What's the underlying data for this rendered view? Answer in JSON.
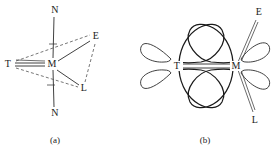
{
  "figure": {
    "panels": [
      {
        "id": "a",
        "caption": "(a)",
        "type": "coordination-geometry",
        "atoms": [
          {
            "key": "n_top",
            "label": "N",
            "x": 54,
            "y": 10
          },
          {
            "key": "t_left",
            "label": "T",
            "x": 8,
            "y": 64
          },
          {
            "key": "m_center",
            "label": "M",
            "x": 52,
            "y": 64
          },
          {
            "key": "e_upper",
            "label": "E",
            "x": 95,
            "y": 37
          },
          {
            "key": "l_lower",
            "label": "L",
            "x": 83,
            "y": 89
          },
          {
            "key": "n_bottom",
            "label": "N",
            "x": 54,
            "y": 113
          }
        ],
        "bonds": [
          {
            "from": "n_top",
            "to": "m_center",
            "style": "solid"
          },
          {
            "from": "m_center",
            "to": "n_bottom",
            "style": "solid"
          },
          {
            "from": "t_left",
            "to": "m_center",
            "style": "double"
          },
          {
            "from": "m_center",
            "to": "e_upper",
            "style": "solid"
          },
          {
            "from": "m_center",
            "to": "l_lower",
            "style": "solid"
          },
          {
            "from": "t_left",
            "to": "e_upper",
            "style": "dashed"
          },
          {
            "from": "t_left",
            "to": "l_lower",
            "style": "dashed"
          },
          {
            "from": "e_upper",
            "to": "l_lower",
            "style": "dashed"
          }
        ]
      },
      {
        "id": "b",
        "caption": "(b)",
        "type": "orbital-overlap",
        "atoms": [
          {
            "key": "t_left",
            "label": "T",
            "x": 38,
            "y": 66
          },
          {
            "key": "m_right",
            "label": "M",
            "x": 97,
            "y": 66
          },
          {
            "key": "e_upper",
            "label": "E",
            "x": 120,
            "y": 12
          },
          {
            "key": "l_lower",
            "label": "L",
            "x": 116,
            "y": 120
          }
        ],
        "bonds": [
          {
            "from": "t_left",
            "to": "m_right",
            "style": "double"
          },
          {
            "from": "m_right",
            "to": "e_upper",
            "style": "thin"
          },
          {
            "from": "m_right",
            "to": "l_lower",
            "style": "thin"
          }
        ],
        "orbitals": [
          {
            "key": "t-outer-upper",
            "owner": "T",
            "direction": "upper-left",
            "size": "small"
          },
          {
            "key": "t-outer-lower",
            "owner": "T",
            "direction": "lower-left",
            "size": "small"
          },
          {
            "key": "m-outer-upper",
            "owner": "M",
            "direction": "upper-right",
            "size": "small"
          },
          {
            "key": "m-outer-lower",
            "owner": "M",
            "direction": "lower-right",
            "size": "small"
          },
          {
            "key": "bridge-upper-from-t",
            "owner": "T",
            "direction": "upper-bridge",
            "size": "large"
          },
          {
            "key": "bridge-upper-from-m",
            "owner": "M",
            "direction": "upper-bridge",
            "size": "large"
          },
          {
            "key": "bridge-lower-from-t",
            "owner": "T",
            "direction": "lower-bridge",
            "size": "large"
          },
          {
            "key": "bridge-lower-from-m",
            "owner": "M",
            "direction": "lower-bridge",
            "size": "large"
          }
        ]
      }
    ]
  },
  "colors": {
    "stroke": "#2b2b2b",
    "stroke_light": "#4a4a4a",
    "background": "#ffffff",
    "text": "#1a1a1a"
  }
}
